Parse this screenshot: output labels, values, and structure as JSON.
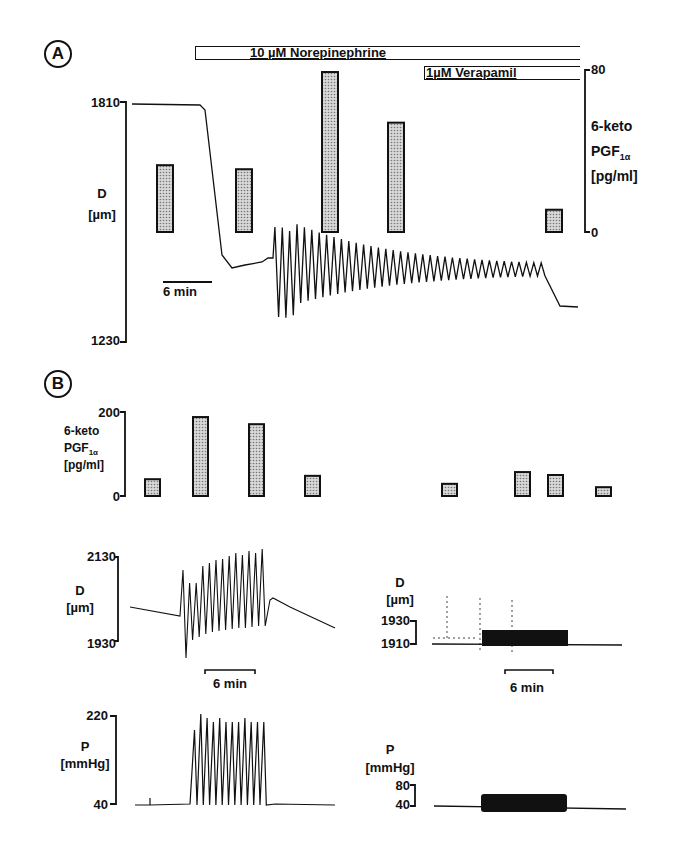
{
  "panel_a": {
    "letter": "A",
    "drug1_label": "10 µM Norepinephrine",
    "drug2_label": "1µM Verapamil",
    "left_axis": {
      "label": "D",
      "unit": "[µm]",
      "top": "1810",
      "bottom": "1230"
    },
    "right_axis": {
      "label_line1": "6-keto",
      "label_line2": "PGF",
      "label_sub": "1α",
      "unit": "[pg/ml]",
      "top": "80",
      "bottom": "0"
    },
    "scale_bar": "6 min"
  },
  "panel_b": {
    "letter": "B",
    "bar_axis": {
      "label_line1": "6-keto",
      "label_line2": "PGF",
      "label_sub": "1α",
      "unit": "[pg/ml]",
      "top": "200",
      "bottom": "0"
    },
    "left_d": {
      "label": "D",
      "unit": "[µm]",
      "top": "2130",
      "bottom": "1930",
      "scale_bar": "6 min"
    },
    "right_d": {
      "label": "D",
      "unit": "[µm]",
      "top": "1930",
      "bottom": "1910",
      "scale_bar": "6 min"
    },
    "left_p": {
      "label": "P",
      "unit": "[mmHg]",
      "top": "220",
      "bottom": "40"
    },
    "right_p": {
      "label": "P",
      "unit": "[mmHg]",
      "top": "80",
      "bottom": "40"
    }
  },
  "colors": {
    "ink": "#111111",
    "bar_fill": "#bdbdbd",
    "background": "#ffffff"
  },
  "chart_data": [
    {
      "panel": "A",
      "type": "bar",
      "title": "Panel A: 6-keto PGF1α release during norepinephrine and verapamil",
      "ylabel": "6-keto PGF1α [pg/ml]",
      "ylim": [
        0,
        80
      ],
      "categories": [
        "baseline",
        "NE early",
        "NE oscillation onset",
        "NE oscillation",
        "NE + verapamil"
      ],
      "values": [
        33,
        31,
        79,
        54,
        11
      ],
      "overlay_trace": {
        "type": "line",
        "ylabel": "D [µm]",
        "ylim": [
          1230,
          1810
        ],
        "description": "Diameter stable at ~1805 µm, drops to ~1450 µm after norepinephrine, then large oscillations (1270–1570) decaying to ~1420 after verapamil",
        "scale_bar": "6 min"
      },
      "annotations": [
        "10 µM Norepinephrine",
        "1µM Verapamil"
      ]
    },
    {
      "panel": "B",
      "type": "bar",
      "ylabel": "6-keto PGF1α [pg/ml]",
      "ylim": [
        0,
        200
      ],
      "categories": [
        "L1",
        "L2",
        "L3",
        "L4",
        "R1",
        "R2",
        "R3",
        "R4"
      ],
      "values": [
        40,
        188,
        171,
        48,
        29,
        57,
        50,
        21
      ]
    },
    {
      "panel": "B-left-D",
      "type": "line",
      "ylabel": "D [µm]",
      "ylim": [
        1930,
        2130
      ],
      "description": "Baseline ~2025 declining, then 13 oscillations (troughs ~1940, peaks rising to ~2125), then relaxation to ~2040 and decline",
      "scale_bar": "6 min"
    },
    {
      "panel": "B-right-D",
      "type": "line",
      "ylabel": "D [µm]",
      "ylim": [
        1910,
        1930
      ],
      "description": "Baseline ~1910 with small high-frequency oscillations up to ~1924 during pressure pulsing",
      "scale_bar": "6 min"
    },
    {
      "panel": "B-left-P",
      "type": "line",
      "ylabel": "P [mmHg]",
      "ylim": [
        40,
        220
      ],
      "description": "Baseline 40 mmHg, 13 pressure pulses to ~200–220 mmHg"
    },
    {
      "panel": "B-right-P",
      "type": "line",
      "ylabel": "P [mmHg]",
      "ylim": [
        40,
        80
      ],
      "description": "Baseline 40 mmHg, high-frequency pulsing between ~38 and ~60 mmHg"
    }
  ]
}
